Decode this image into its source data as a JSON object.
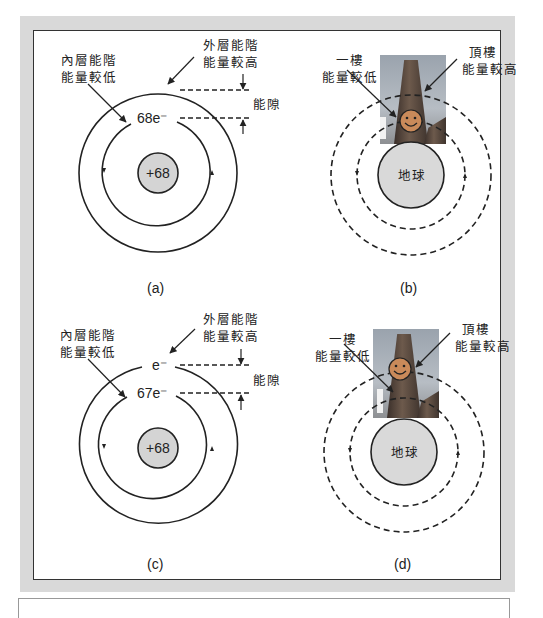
{
  "figure": {
    "panels": [
      {
        "id": "a",
        "caption": "(a)",
        "type": "atom",
        "outer_label": [
          "外層能階",
          "能量較高"
        ],
        "inner_label": [
          "內層能階",
          "能量較低"
        ],
        "gap_label": "能隙",
        "outer_electron": "",
        "inner_electron": "68e⁻",
        "nucleus": "+68"
      },
      {
        "id": "b",
        "caption": "(b)",
        "type": "analogy",
        "outer_label": [
          "頂樓",
          "能量較高"
        ],
        "inner_label": [
          "一樓",
          "能量較低"
        ],
        "center": "地球",
        "person_position": "first-floor"
      },
      {
        "id": "c",
        "caption": "(c)",
        "type": "atom",
        "outer_label": [
          "外層能階",
          "能量較高"
        ],
        "inner_label": [
          "內層能階",
          "能量較低"
        ],
        "gap_label": "能隙",
        "outer_electron": "e⁻",
        "inner_electron": "67e⁻",
        "nucleus": "+68"
      },
      {
        "id": "d",
        "caption": "(d)",
        "type": "analogy",
        "outer_label": [
          "頂樓",
          "能量較高"
        ],
        "inner_label": [
          "一樓",
          "能量較低"
        ],
        "center": "地球",
        "person_position": "top-floor"
      }
    ]
  },
  "colors": {
    "frame": "#d9d9d9",
    "nucleus_fill": "#d4d4d4",
    "earth_fill": "#d9d9d9",
    "stroke": "#222222",
    "smiley_fill": "#c98a5a"
  }
}
